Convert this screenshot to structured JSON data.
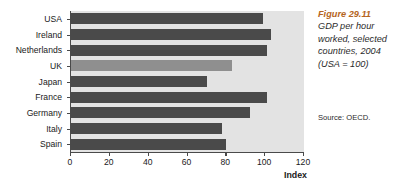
{
  "chart_data": {
    "type": "bar",
    "orientation": "horizontal",
    "figure_number": "Figure 29.11",
    "caption_lines": [
      "GDP per hour",
      "worked, selected",
      "countries, 2004",
      "(USA = 100)"
    ],
    "categories": [
      "USA",
      "Ireland",
      "Netherlands",
      "UK",
      "Japan",
      "France",
      "Germany",
      "Italy",
      "Spain"
    ],
    "values": [
      99,
      103,
      101,
      83,
      70,
      101,
      92,
      78,
      80
    ],
    "highlight_category": "UK",
    "xlabel": "Index",
    "ylabel": "",
    "xlim": [
      0,
      120
    ],
    "xticks": [
      0,
      20,
      40,
      60,
      80,
      100,
      120
    ],
    "xtick_labels": [
      "0",
      "20",
      "40",
      "60",
      "80",
      "100",
      "120"
    ],
    "grid": false,
    "legend": null,
    "source": "Source: OECD.",
    "colors": {
      "bar": "#4a4a4a",
      "bar_highlight": "#8f8f8f",
      "plot_background": "#e3e3e3",
      "axis": "#4a4a4a",
      "figure_number": "#b5651d",
      "caption_text": "#2b2b2b",
      "page_background": "#ffffff"
    }
  }
}
